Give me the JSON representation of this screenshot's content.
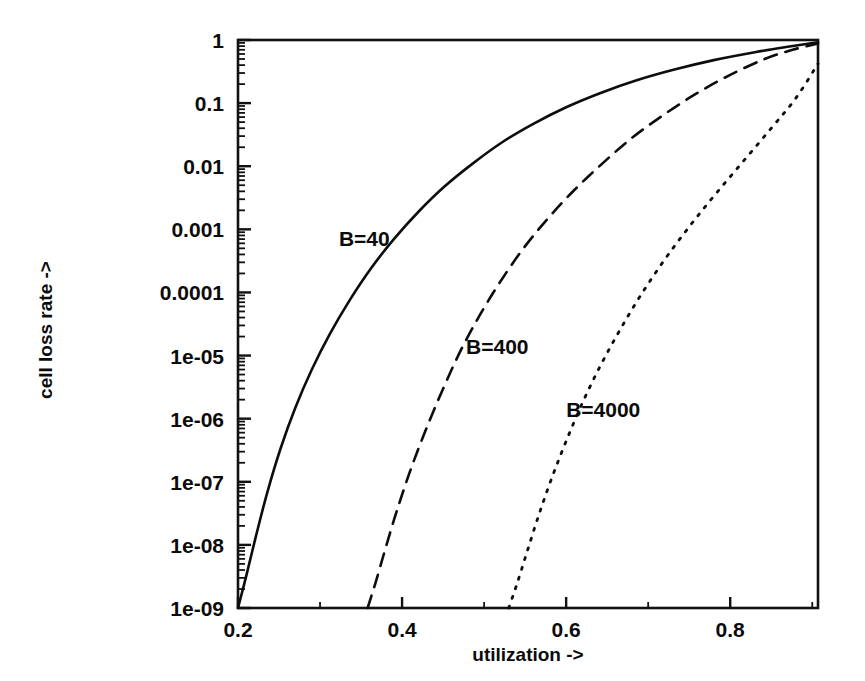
{
  "figure": {
    "background": "#ffffff",
    "ink_color": "#0d0d0d"
  },
  "chart_data": {
    "type": "line",
    "title": "",
    "xlabel": "utilization ->",
    "ylabel": "cell loss rate ->",
    "xscale": "linear",
    "yscale": "log",
    "xlim": [
      0.2,
      0.907
    ],
    "ylim": [
      1e-09,
      1
    ],
    "grid": false,
    "legend_position": "inline-curve-labels",
    "xticks": [
      0.2,
      0.4,
      0.6,
      0.8
    ],
    "xtick_labels": [
      "0.2",
      "0.4",
      "0.6",
      "0.8"
    ],
    "yticks": [
      1,
      0.1,
      0.01,
      0.001,
      0.0001,
      1e-05,
      1e-06,
      1e-07,
      1e-08,
      1e-09
    ],
    "ytick_labels": [
      "1",
      "0.1",
      "0.01",
      "0.001",
      "0.0001",
      "1e-05",
      "1e-06",
      "1e-07",
      "1e-08",
      "1e-09"
    ],
    "series": [
      {
        "name": "B=40",
        "style": "solid",
        "label": "B=40",
        "label_at": [
          0.323,
          0.00055
        ],
        "x": [
          0.2,
          0.21,
          0.222,
          0.236,
          0.252,
          0.27,
          0.29,
          0.312,
          0.336,
          0.362,
          0.39,
          0.42,
          0.452,
          0.486,
          0.522,
          0.56,
          0.6,
          0.642,
          0.686,
          0.732,
          0.78,
          0.83,
          0.87,
          0.907
        ],
        "y": [
          1e-09,
          3.2e-09,
          1.4e-08,
          7e-08,
          3.4e-07,
          1.5e-06,
          6e-06,
          2.2e-05,
          7.5e-05,
          0.00024,
          0.0007,
          0.0019,
          0.0048,
          0.011,
          0.024,
          0.047,
          0.086,
          0.145,
          0.23,
          0.34,
          0.48,
          0.64,
          0.78,
          0.92
        ]
      },
      {
        "name": "B=400",
        "style": "dashed",
        "label": "B=400",
        "label_at": [
          0.478,
          1.05e-05
        ],
        "x": [
          0.358,
          0.368,
          0.38,
          0.394,
          0.41,
          0.428,
          0.448,
          0.47,
          0.494,
          0.52,
          0.548,
          0.578,
          0.61,
          0.644,
          0.68,
          0.718,
          0.758,
          0.8,
          0.842,
          0.876,
          0.907
        ],
        "y": [
          1e-09,
          2.6e-09,
          9e-09,
          3.6e-08,
          1.5e-07,
          6.2e-07,
          2.6e-06,
          1.1e-05,
          4.2e-05,
          0.00015,
          0.0005,
          0.0015,
          0.0042,
          0.011,
          0.028,
          0.064,
          0.14,
          0.28,
          0.5,
          0.7,
          0.88
        ]
      },
      {
        "name": "B=4000",
        "style": "dotted",
        "label": "B=4000",
        "label_at": [
          0.6,
          1.05e-06
        ],
        "x": [
          0.53,
          0.54,
          0.552,
          0.566,
          0.582,
          0.6,
          0.62,
          0.642,
          0.666,
          0.692,
          0.72,
          0.75,
          0.782,
          0.816,
          0.85,
          0.88,
          0.907
        ],
        "y": [
          1e-09,
          2.4e-09,
          7.5e-09,
          2.8e-08,
          1.1e-07,
          4.4e-07,
          1.8e-06,
          7e-06,
          2.6e-05,
          9.5e-05,
          0.00033,
          0.0011,
          0.0036,
          0.012,
          0.04,
          0.12,
          0.42
        ]
      }
    ]
  }
}
